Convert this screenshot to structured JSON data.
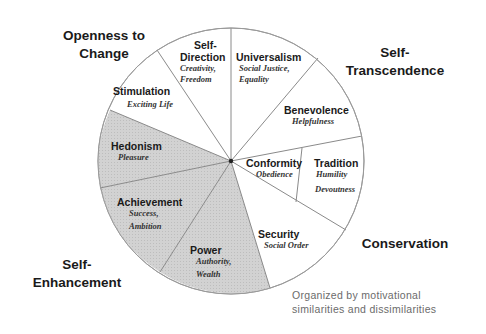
{
  "diagram": {
    "center": [
      231,
      161
    ],
    "radius": 133,
    "colors": {
      "shaded_fill": "#cfcfcf",
      "light_fill": "#ffffff",
      "stroke": "#8a8a8a",
      "text": "#1a1a1a",
      "caption": "#6b6b6b"
    },
    "groups": [
      {
        "id": "openness",
        "line1": "Openness to",
        "line2": "Change"
      },
      {
        "id": "self-transcendence",
        "line1": "Self-",
        "line2": "Transcendence"
      },
      {
        "id": "conservation",
        "line1": "Conservation",
        "line2": ""
      },
      {
        "id": "self-enhancement",
        "line1": "Self-",
        "line2": "Enhancement"
      }
    ],
    "values": [
      {
        "id": "self-direction",
        "name_line1": "Self-",
        "name_line2": "Direction",
        "desc_line1": "Creativity,",
        "desc_line2": "Freedom",
        "shaded": false
      },
      {
        "id": "universalism",
        "name_line1": "Universalism",
        "name_line2": "",
        "desc_line1": "Social Justice,",
        "desc_line2": "Equality",
        "shaded": false
      },
      {
        "id": "benevolence",
        "name_line1": "Benevolence",
        "name_line2": "",
        "desc_line1": "Helpfulness",
        "desc_line2": "",
        "shaded": false
      },
      {
        "id": "conformity",
        "name_line1": "Conformity",
        "name_line2": "",
        "desc_line1": "Obedience",
        "desc_line2": "",
        "shaded": false
      },
      {
        "id": "tradition",
        "name_line1": "Tradition",
        "name_line2": "",
        "desc_line1": "Humility",
        "desc_line2": "Devoutness",
        "shaded": false
      },
      {
        "id": "security",
        "name_line1": "Security",
        "name_line2": "",
        "desc_line1": "Social Order",
        "desc_line2": "",
        "shaded": false
      },
      {
        "id": "power",
        "name_line1": "Power",
        "name_line2": "",
        "desc_line1": "Authority,",
        "desc_line2": "Wealth",
        "shaded": true
      },
      {
        "id": "achievement",
        "name_line1": "Achievement",
        "name_line2": "",
        "desc_line1": "Success,",
        "desc_line2": "Ambition",
        "shaded": true
      },
      {
        "id": "hedonism",
        "name_line1": "Hedonism",
        "name_line2": "",
        "desc_line1": "Pleasure",
        "desc_line2": "",
        "shaded": true
      },
      {
        "id": "stimulation",
        "name_line1": "Stimulation",
        "name_line2": "",
        "desc_line1": "Exciting Life",
        "desc_line2": "",
        "shaded": false
      }
    ],
    "caption_line1": "Organized by motivational",
    "caption_line2": "similarities and dissimilarities"
  }
}
